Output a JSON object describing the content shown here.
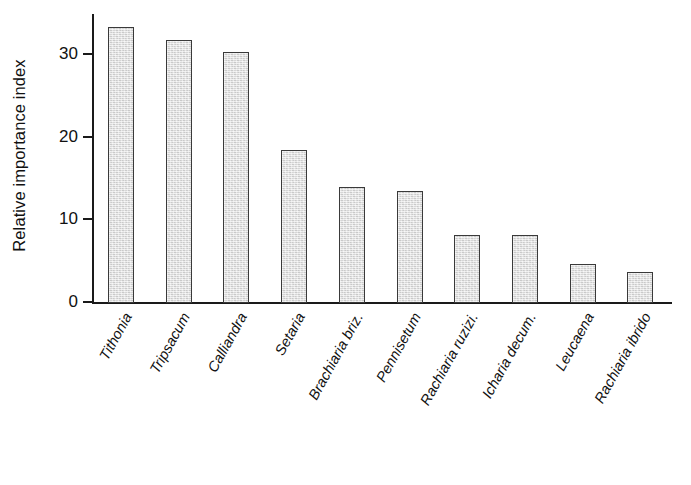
{
  "chart_data": {
    "type": "bar",
    "title": "",
    "xlabel": "",
    "ylabel": "Relative importance index",
    "ylim": [
      0,
      35
    ],
    "yticks": [
      0,
      10,
      20,
      30
    ],
    "ytick_labels": [
      "0",
      "10",
      "20",
      "30"
    ],
    "grid": false,
    "legend": false,
    "bar_fill_color": "#dcdcdc",
    "bar_edge_color": "#3a3a3a",
    "axis_color": "#1a1a1a",
    "categories": [
      "Tithonia",
      "Tripsacum",
      "Calliandra",
      "Setaria",
      "Brachiaria briz.",
      "Pennisetum",
      "Rachiaria ruzizi.",
      "Icharia decum.",
      "Leucaena",
      "Rachiaria ibrido"
    ],
    "values": [
      33.4,
      31.9,
      30.4,
      18.5,
      14.1,
      13.6,
      8.2,
      8.2,
      4.7,
      3.7
    ]
  }
}
